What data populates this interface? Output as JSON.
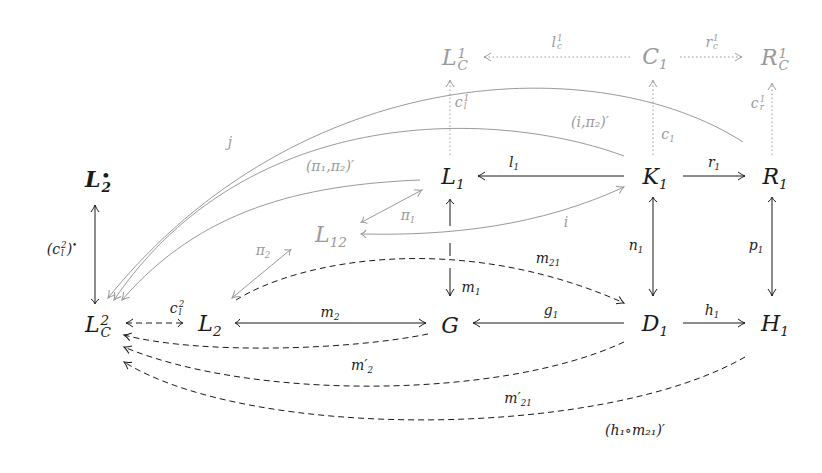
{
  "diagram": {
    "nodes": {
      "LC1": {
        "base": "L",
        "sup": "1",
        "sub": "C"
      },
      "C1": {
        "base": "C",
        "sub": "1"
      },
      "RC1": {
        "base": "R",
        "sup": "1",
        "sub": "C"
      },
      "L2dot": {
        "base": "L",
        "sup": "•",
        "sub": "2"
      },
      "L1": {
        "base": "L",
        "sub": "1"
      },
      "K1": {
        "base": "K",
        "sub": "1"
      },
      "R1": {
        "base": "R",
        "sub": "1"
      },
      "L12": {
        "base": "L",
        "sub": "12"
      },
      "LC2": {
        "base": "L",
        "sup": "2",
        "sub": "C"
      },
      "L2": {
        "base": "L",
        "sub": "2"
      },
      "G": {
        "base": "G"
      },
      "D1": {
        "base": "D",
        "sub": "1"
      },
      "H1": {
        "base": "H",
        "sub": "1"
      }
    },
    "labels": {
      "lc1": {
        "base": "l",
        "sup": "1",
        "sub": "c"
      },
      "rc1": {
        "base": "r",
        "sup": "1",
        "sub": "c"
      },
      "cl1": {
        "base": "c",
        "sup": "1",
        "sub": "l"
      },
      "cr1": {
        "base": "c",
        "sup": "1",
        "sub": "r"
      },
      "c1": {
        "base": "c",
        "sub": "1"
      },
      "j": "j",
      "i_pi2": "(i,π₂)′",
      "pi1_pi2": "(π₁,π₂)′",
      "l1": {
        "base": "l",
        "sub": "1"
      },
      "r1": {
        "base": "r",
        "sub": "1"
      },
      "pi1": {
        "base": "π",
        "sub": "1"
      },
      "pi2": {
        "base": "π",
        "sub": "2"
      },
      "i": "i",
      "cl2_dot": "(c",
      "cl2_dot_full": "(c_l^2)•",
      "n1": {
        "base": "n",
        "sub": "1"
      },
      "p1": {
        "base": "p",
        "sub": "1"
      },
      "m21": {
        "base": "m",
        "sub": "21"
      },
      "m1": {
        "base": "m",
        "sub": "1"
      },
      "cl2": {
        "base": "c",
        "sup": "2",
        "sub": "l"
      },
      "m2": {
        "base": "m",
        "sub": "2"
      },
      "g1": {
        "base": "g",
        "sub": "1"
      },
      "h1": {
        "base": "h",
        "sub": "1"
      },
      "m2p": {
        "base": "m′",
        "sub": "2"
      },
      "m21p": {
        "base": "m′",
        "sub": "21"
      },
      "h1m21": "(h₁∘m₂₁)′"
    },
    "colors": {
      "ink": "#1a1a1a",
      "gray": "#9a9a9a"
    }
  }
}
